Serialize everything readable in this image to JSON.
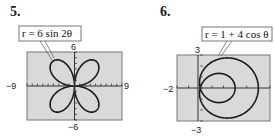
{
  "chart_data": [
    {
      "number": "5.",
      "type": "line",
      "plot_kind": "polar",
      "equation": "r = 6 sin 2θ",
      "title": "",
      "xlim": [
        -9,
        9
      ],
      "ylim": [
        -6,
        6
      ],
      "x_tick_labels": [
        "-9",
        "9"
      ],
      "y_tick_labels": [
        "6",
        "-6"
      ],
      "xscale_ticks": 1,
      "grid": false,
      "curve": "four-petal rose, petal length 6",
      "background": "#d9d9d9"
    },
    {
      "number": "6.",
      "type": "line",
      "plot_kind": "polar",
      "equation": "r = 1 + 4 cos θ",
      "title": "",
      "xlim": [
        -2,
        6
      ],
      "ylim": [
        -3,
        3
      ],
      "x_tick_labels": [
        "-2"
      ],
      "y_tick_labels": [
        "3",
        "-3"
      ],
      "xscale_ticks": 1,
      "grid": false,
      "curve": "limaçon with inner loop (outer loop reaches x=5, inner loop reaches x=3)",
      "background": "#d9d9d9"
    }
  ],
  "labels": {
    "p5_num": "5.",
    "p6_num": "6.",
    "p5_eq": "r = 6 sin 2θ",
    "p6_eq": "r = 1 + 4 cos θ",
    "p5_xmin": "−9",
    "p5_xmax": "9",
    "p5_ymax": "6",
    "p5_ymin": "−6",
    "p6_xmin": "−2",
    "p6_ymax": "3",
    "p6_ymin": "−3"
  }
}
